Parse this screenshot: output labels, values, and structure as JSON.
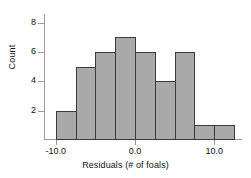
{
  "chart_data": {
    "type": "bar",
    "title": "",
    "subtitle": "",
    "xlabel": "Residuals (# of foals)",
    "ylabel": "Count",
    "grid": false,
    "legend": null,
    "bin_width": 2.5,
    "bin_starts": [
      -10.0,
      -7.5,
      -5.0,
      -2.5,
      0.0,
      2.5,
      5.0,
      7.5,
      10.0
    ],
    "bin_ends": [
      -7.5,
      -5.0,
      -2.5,
      0.0,
      2.5,
      5.0,
      7.5,
      10.0,
      12.5
    ],
    "categories": [
      "-10.0 to -7.5",
      "-7.5 to -5.0",
      "-5.0 to -2.5",
      "-2.5 to 0.0",
      "0.0 to 2.5",
      "2.5 to 5.0",
      "5.0 to 7.5",
      "7.5 to 10.0",
      "10.0 to 12.5"
    ],
    "values": [
      2,
      5,
      6,
      7,
      6,
      4,
      6,
      1,
      1
    ],
    "xlim": [
      -11.5,
      13.5
    ],
    "ylim": [
      0,
      8.6
    ],
    "xticks": [
      -10.0,
      0.0,
      10.0
    ],
    "xtick_labels": [
      "-10.0",
      "0.0",
      "10.0"
    ],
    "yticks": [
      2,
      4,
      6,
      8
    ],
    "ytick_labels": [
      "2",
      "4",
      "6",
      "8"
    ],
    "bar_fill_color": "#a9a9a9",
    "bar_edge_color": "#3a3a3a",
    "axis_color": "#9a9a9a",
    "text_color": "#111111"
  }
}
